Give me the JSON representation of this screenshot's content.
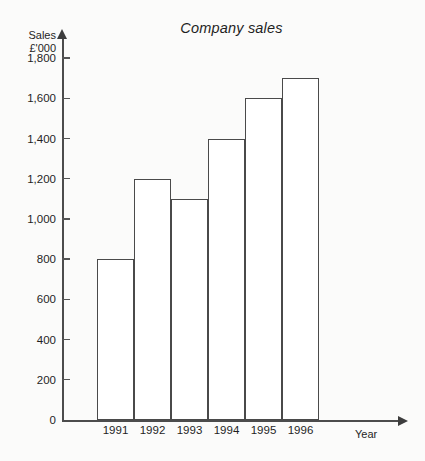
{
  "chart_data": {
    "type": "bar",
    "title": "Company sales",
    "xlabel": "Year",
    "ylabel_line1": "Sales",
    "ylabel_line2": "£'000",
    "categories": [
      "1991",
      "1992",
      "1993",
      "1994",
      "1995",
      "1996"
    ],
    "values": [
      800,
      1200,
      1100,
      1400,
      1600,
      1700
    ],
    "ylim": [
      0,
      1900
    ],
    "ytick_values": [
      0,
      200,
      400,
      600,
      800,
      1000,
      1200,
      1400,
      1600,
      1800
    ],
    "ytick_labels": [
      "0",
      "200",
      "400",
      "600",
      "800",
      "1,000",
      "1,200",
      "1,400",
      "1,600",
      "1,800"
    ],
    "grid": false,
    "legend": "none",
    "bar_style": {
      "fill": "#ffffff",
      "stroke": "#4a4a4a",
      "adjacent": true
    },
    "axis_color": "#4c4c4c",
    "background": "#fbfbfa"
  }
}
